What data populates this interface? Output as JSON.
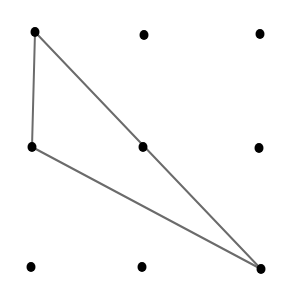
{
  "diagram": {
    "type": "dot-grid-triangle",
    "grid": {
      "rows": 3,
      "cols": 3
    },
    "colors": {
      "background": "#ffffff",
      "dot": "#000000",
      "line": "#6b6b6b"
    },
    "dots": [
      {
        "id": "r0c0",
        "x": 35,
        "y": 32
      },
      {
        "id": "r0c1",
        "x": 144,
        "y": 35
      },
      {
        "id": "r0c2",
        "x": 260,
        "y": 34
      },
      {
        "id": "r1c0",
        "x": 32,
        "y": 147
      },
      {
        "id": "r1c1",
        "x": 143,
        "y": 147
      },
      {
        "id": "r1c2",
        "x": 259,
        "y": 148
      },
      {
        "id": "r2c0",
        "x": 31,
        "y": 267
      },
      {
        "id": "r2c1",
        "x": 142,
        "y": 267
      },
      {
        "id": "r2c2",
        "x": 261,
        "y": 269
      }
    ],
    "triangle": {
      "vertices": [
        "r0c0",
        "r1c0",
        "r2c2"
      ],
      "edges": [
        {
          "from": "r0c0",
          "to": "r1c0"
        },
        {
          "from": "r1c0",
          "to": "r2c2"
        },
        {
          "from": "r0c0",
          "to": "r2c2"
        }
      ]
    }
  }
}
